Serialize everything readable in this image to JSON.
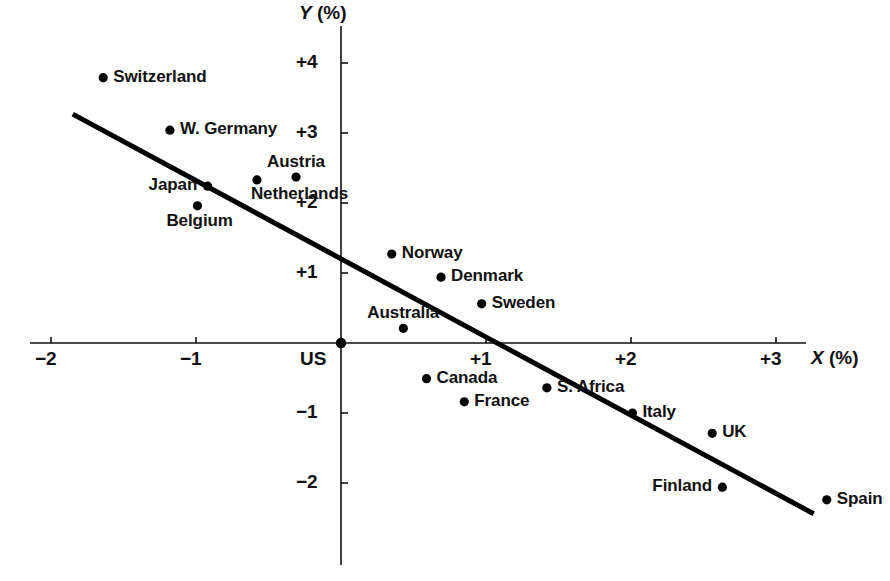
{
  "chart_data": {
    "type": "scatter",
    "title": "",
    "xlabel": "X (%)",
    "ylabel": "Y (%)",
    "xlim": [
      -2.35,
      3.45
    ],
    "ylim": [
      -2.95,
      4.45
    ],
    "grid": false,
    "legend": "none",
    "xticks": [
      {
        "value": -2,
        "label": "−2"
      },
      {
        "value": -1,
        "label": "−1"
      },
      {
        "value": 1,
        "label": "+1"
      },
      {
        "value": 2,
        "label": "+2"
      },
      {
        "value": 3,
        "label": "+3"
      }
    ],
    "yticks": [
      {
        "value": 4,
        "label": "+4"
      },
      {
        "value": 3,
        "label": "+3"
      },
      {
        "value": 2,
        "label": "+2"
      },
      {
        "value": 1,
        "label": "+1"
      },
      {
        "value": -1,
        "label": "−1"
      },
      {
        "value": -2,
        "label": "−2"
      }
    ],
    "origin_label": "US",
    "points": [
      {
        "name": "Switzerland",
        "x": -1.64,
        "y": 3.79,
        "label_side": "right"
      },
      {
        "name": "W. Germany",
        "x": -1.18,
        "y": 3.04,
        "label_side": "right"
      },
      {
        "name": "Austria",
        "x": -0.31,
        "y": 2.37,
        "label_side": "above"
      },
      {
        "name": "Netherlands",
        "x": -0.58,
        "y": 2.33,
        "label_side": "below-right"
      },
      {
        "name": "Japan",
        "x": -0.92,
        "y": 2.24,
        "label_side": "left"
      },
      {
        "name": "Belgium",
        "x": -0.99,
        "y": 1.96,
        "label_side": "below"
      },
      {
        "name": "Norway",
        "x": 0.35,
        "y": 1.27,
        "label_side": "right"
      },
      {
        "name": "Denmark",
        "x": 0.69,
        "y": 0.94,
        "label_side": "right"
      },
      {
        "name": "Sweden",
        "x": 0.97,
        "y": 0.56,
        "label_side": "right"
      },
      {
        "name": "Australia",
        "x": 0.43,
        "y": 0.21,
        "label_side": "above"
      },
      {
        "name": "US",
        "x": 0,
        "y": 0,
        "label_side": "origin"
      },
      {
        "name": "Canada",
        "x": 0.59,
        "y": -0.51,
        "label_side": "right"
      },
      {
        "name": "France",
        "x": 0.85,
        "y": -0.84,
        "label_side": "right"
      },
      {
        "name": "S. Africa",
        "x": 1.42,
        "y": -0.64,
        "label_side": "right"
      },
      {
        "name": "Italy",
        "x": 2.01,
        "y": -1.0,
        "label_side": "right"
      },
      {
        "name": "UK",
        "x": 2.56,
        "y": -1.29,
        "label_side": "right"
      },
      {
        "name": "Finland",
        "x": 2.63,
        "y": -2.06,
        "label_side": "left"
      },
      {
        "name": "Spain",
        "x": 3.35,
        "y": -2.24,
        "label_side": "right"
      }
    ],
    "fit_line": {
      "label": "regression-line",
      "x_start": -1.85,
      "y_start": 3.27,
      "x_end": 3.26,
      "y_end": -2.44
    }
  },
  "geometry": {
    "origin_px": {
      "x": 341,
      "y": 343
    },
    "x_unit_px": 145,
    "y_unit_px": 70,
    "x_axis": {
      "x1": 30,
      "x2": 806
    },
    "y_axis": {
      "y1": 26,
      "y2": 565
    },
    "dot_radius": 4.6
  },
  "colors": {
    "ink": "#111111",
    "line": "#000000",
    "background": "#ffffff"
  }
}
